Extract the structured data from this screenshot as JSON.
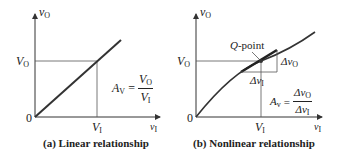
{
  "panel_a": {
    "caption": "(a)  Linear relationship",
    "y_axis_label": "v",
    "y_axis_sub": "O",
    "x_axis_label": "v",
    "x_axis_sub": "I",
    "origin": "0",
    "vo_tick": "V",
    "vo_tick_sub": "O",
    "vi_tick": "V",
    "vi_tick_sub": "I",
    "gain_lhs": "A",
    "gain_lhs_sub": "V",
    "gain_num": "V",
    "gain_num_sub": "O",
    "gain_den": "V",
    "gain_den_sub": "I"
  },
  "panel_b": {
    "caption": "(b)  Nonlinear relationship",
    "y_axis_label": "v",
    "y_axis_sub": "O",
    "x_axis_label": "v",
    "x_axis_sub": "I",
    "origin": "0",
    "vo_tick": "V",
    "vo_tick_sub": "O",
    "vi_tick": "V",
    "vi_tick_sub": "I",
    "q_point": "Q",
    "q_point_suffix": "-point",
    "delta_vo": "Δv",
    "delta_vo_sub": "O",
    "delta_vi": "Δv",
    "delta_vi_sub": "I",
    "gain_lhs": "A",
    "gain_lhs_sub": "v",
    "gain_num": "Δv",
    "gain_num_sub": "O",
    "gain_den": "Δv",
    "gain_den_sub": "I"
  },
  "colors": {
    "curve": "#333333",
    "axis": "#333333",
    "guide": "#555555"
  }
}
